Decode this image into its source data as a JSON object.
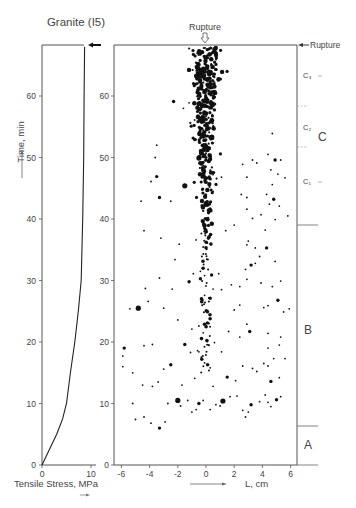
{
  "title": "Granite (I5)",
  "left_panel": {
    "ylabel": "Time, min",
    "xlabel": "Tensile Stress, MPa",
    "xticks": [
      "0",
      "10"
    ],
    "yticks": [
      "0",
      "10",
      "20",
      "30",
      "40",
      "50",
      "60"
    ]
  },
  "main_panel": {
    "top_label": "Rupture",
    "right_label": "Rupture",
    "xlabel": "L, cm",
    "xticks": [
      "-6",
      "-4",
      "-2",
      "0",
      "2",
      "4",
      "6"
    ],
    "yticks": [
      "0",
      "10",
      "20",
      "30",
      "40",
      "50",
      "60"
    ]
  },
  "stages": {
    "A": "A",
    "B": "B",
    "C": "C",
    "C1": "C₁",
    "C2": "C₂",
    "C3": "C₃"
  },
  "chart_data": [
    {
      "type": "line",
      "title": "Granite (I5)",
      "xlabel": "Tensile Stress, MPa",
      "ylabel": "Time, min",
      "xlim": [
        0,
        11
      ],
      "ylim": [
        0,
        68
      ],
      "series": [
        {
          "name": "Tensile stress vs time",
          "x": [
            0,
            1.5,
            3,
            4.2,
            5.0,
            5.8,
            6.7,
            7.4,
            8.0,
            8.3,
            8.5,
            8.6,
            8.7
          ],
          "y": [
            0,
            2.5,
            5,
            7.5,
            10,
            15,
            20,
            25,
            30,
            40,
            50,
            60,
            68
          ]
        }
      ],
      "annotations": [
        "Rupture arrow at t≈68 min"
      ]
    },
    {
      "type": "scatter",
      "xlabel": "L, cm",
      "ylabel": "Time, min",
      "xlim": [
        -6.5,
        6.5
      ],
      "ylim": [
        0,
        68
      ],
      "annotations": [
        "Rupture (top, at L=0)",
        "Rupture (right, t≈68)",
        "Stage A: 0–6 min",
        "Stage B: 6–39 min",
        "Stage C: 39–68 min (C1, C2, C3 sub-stages)"
      ],
      "stage_boundaries_min": [
        6.3,
        38.8,
        51.5,
        58.5,
        68
      ],
      "points": [
        [
          -5.8,
          19,
          2
        ],
        [
          -4.8,
          25.5,
          3
        ],
        [
          -5.4,
          25.4,
          1
        ],
        [
          -5.9,
          17.7,
          1
        ],
        [
          -5.9,
          16,
          1
        ],
        [
          -5.2,
          10,
          1
        ],
        [
          -5.0,
          7.4,
          1
        ],
        [
          -4.4,
          7.8,
          1
        ],
        [
          -3.9,
          6.8,
          1
        ],
        [
          -3.3,
          6,
          2
        ],
        [
          -2.9,
          7,
          1
        ],
        [
          -5.2,
          15,
          1
        ],
        [
          -4.5,
          13,
          1
        ],
        [
          -3.8,
          12.8,
          1
        ],
        [
          -3.4,
          13.5,
          1
        ],
        [
          -2.5,
          16.3,
          2
        ],
        [
          -2.0,
          10.5,
          3
        ],
        [
          -1.8,
          9.6,
          1
        ],
        [
          -2.7,
          10,
          1
        ],
        [
          -1.3,
          10.5,
          1
        ],
        [
          -1.0,
          8.6,
          1
        ],
        [
          -0.7,
          9,
          1
        ],
        [
          -0.5,
          10,
          2
        ],
        [
          -0.2,
          10.5,
          1
        ],
        [
          0.3,
          9,
          1
        ],
        [
          0.7,
          9.8,
          1
        ],
        [
          1.0,
          9.6,
          1
        ],
        [
          0.5,
          12.8,
          1
        ],
        [
          1.2,
          10.4,
          3
        ],
        [
          1.7,
          11.1,
          1
        ],
        [
          2.2,
          11.2,
          1
        ],
        [
          2.6,
          8.9,
          1
        ],
        [
          2.8,
          7.8,
          1
        ],
        [
          3.0,
          8.6,
          1
        ],
        [
          3.2,
          9.8,
          2
        ],
        [
          3.8,
          10.3,
          1
        ],
        [
          4.2,
          11.4,
          1
        ],
        [
          4.4,
          10.2,
          1
        ],
        [
          4.6,
          9.5,
          1
        ],
        [
          5.0,
          10.6,
          2
        ],
        [
          5.3,
          11.1,
          1
        ],
        [
          -0.3,
          17.2,
          2
        ],
        [
          -0.5,
          18.4,
          1
        ],
        [
          0.2,
          19.5,
          1
        ],
        [
          0.1,
          20.1,
          1
        ],
        [
          -0.6,
          18.6,
          1
        ],
        [
          -0.1,
          16.6,
          1
        ],
        [
          0.3,
          15.8,
          1
        ],
        [
          -0.8,
          14.1,
          1
        ],
        [
          -1.7,
          13,
          1
        ],
        [
          -3.0,
          15.6,
          1
        ],
        [
          -3.8,
          19.6,
          1
        ],
        [
          -4.4,
          19.4,
          1
        ],
        [
          -1.5,
          19.6,
          2
        ],
        [
          -1.1,
          18.3,
          1
        ],
        [
          -0.2,
          21.5,
          1
        ],
        [
          1.1,
          18.4,
          1
        ],
        [
          1.5,
          14.3,
          2
        ],
        [
          2.1,
          13.7,
          1
        ],
        [
          2.6,
          16.1,
          1
        ],
        [
          3.3,
          15.7,
          1
        ],
        [
          3.6,
          15.2,
          1
        ],
        [
          4.1,
          16.5,
          1
        ],
        [
          4.4,
          16.1,
          1
        ],
        [
          4.6,
          13.6,
          2
        ],
        [
          5.2,
          14.2,
          1
        ],
        [
          5.6,
          17.3,
          1
        ],
        [
          4.4,
          21.4,
          1
        ],
        [
          4.8,
          17.3,
          1
        ],
        [
          5.3,
          20.8,
          1
        ],
        [
          5.2,
          19.5,
          1
        ],
        [
          2.9,
          22.9,
          1
        ],
        [
          3.1,
          21.7,
          2
        ],
        [
          2.4,
          20.8,
          1
        ],
        [
          4.4,
          19.0,
          1
        ],
        [
          0.6,
          19.9,
          1
        ],
        [
          1.6,
          21.7,
          1
        ],
        [
          0.1,
          23.1,
          2
        ],
        [
          -0.5,
          22.6,
          1
        ],
        [
          -1.0,
          22.1,
          1
        ],
        [
          -2.0,
          23.6,
          1
        ],
        [
          -3.0,
          25.5,
          1
        ],
        [
          -2.4,
          28.6,
          1
        ],
        [
          -3.3,
          30.4,
          1
        ],
        [
          -4.1,
          26.6,
          1
        ],
        [
          -4.3,
          28.7,
          1
        ],
        [
          -1.2,
          29.8,
          2
        ],
        [
          -0.9,
          31.1,
          1
        ],
        [
          -0.4,
          31.5,
          1
        ],
        [
          -0.4,
          30.3,
          2
        ],
        [
          0.0,
          29.1,
          1
        ],
        [
          0.4,
          30.9,
          2
        ],
        [
          0.9,
          31.1,
          1
        ],
        [
          0.3,
          27.1,
          2
        ],
        [
          -0.1,
          27.6,
          1
        ],
        [
          -0.1,
          30.8,
          1
        ],
        [
          0.5,
          28.6,
          1
        ],
        [
          1.1,
          28.5,
          1
        ],
        [
          1.8,
          29.3,
          1
        ],
        [
          2.4,
          29.0,
          1
        ],
        [
          2.9,
          30.2,
          1
        ],
        [
          2.8,
          31.8,
          1
        ],
        [
          3.2,
          32.5,
          2
        ],
        [
          4.7,
          29.0,
          1
        ],
        [
          5.3,
          29.9,
          1
        ],
        [
          3.9,
          29.6,
          1
        ],
        [
          3.5,
          32.8,
          1
        ],
        [
          4.9,
          33.1,
          1
        ],
        [
          5.1,
          26.8,
          2
        ],
        [
          4.4,
          25.9,
          1
        ],
        [
          4.1,
          25.6,
          1
        ],
        [
          5.9,
          25.4,
          1
        ],
        [
          5.5,
          24.9,
          1
        ],
        [
          2.4,
          26.0,
          1
        ],
        [
          2.0,
          25.2,
          1
        ],
        [
          2.9,
          35.8,
          1
        ],
        [
          3.5,
          35.3,
          1
        ],
        [
          3.8,
          33.9,
          1
        ],
        [
          4.3,
          35.3,
          2
        ],
        [
          1.4,
          38.1,
          1
        ],
        [
          2.0,
          39.0,
          1
        ],
        [
          3.3,
          40.1,
          1
        ],
        [
          3.9,
          40.7,
          1
        ],
        [
          4.5,
          42.4,
          1
        ],
        [
          4.8,
          43.2,
          2
        ],
        [
          5.2,
          42.1,
          1
        ],
        [
          5.8,
          40.5,
          1
        ],
        [
          4.9,
          39.9,
          1
        ],
        [
          4.2,
          38.2,
          1
        ],
        [
          3.0,
          36.4,
          1
        ],
        [
          -0.7,
          36.6,
          1
        ],
        [
          -1.9,
          35.9,
          1
        ],
        [
          -2.2,
          33.4,
          1
        ],
        [
          -3.2,
          36.9,
          1
        ],
        [
          -4.4,
          38.1,
          1
        ],
        [
          -4.6,
          42.9,
          1
        ],
        [
          -3.3,
          43.5,
          2
        ],
        [
          -2.5,
          42.9,
          1
        ],
        [
          -3.5,
          46.9,
          2
        ],
        [
          -1.5,
          45.4,
          3
        ],
        [
          -3.9,
          46.1,
          1
        ],
        [
          -3.6,
          50.0,
          1
        ],
        [
          -3.5,
          52.0,
          1
        ],
        [
          -0.5,
          49.9,
          3
        ],
        [
          -0.8,
          56.1,
          1
        ],
        [
          -2.3,
          59.1,
          2
        ],
        [
          -1.2,
          58.9,
          1
        ],
        [
          -1.6,
          58.0,
          1
        ],
        [
          1.1,
          46.8,
          1
        ],
        [
          2.6,
          48.9,
          1
        ],
        [
          3.3,
          49.6,
          1
        ],
        [
          3.6,
          49.1,
          1
        ],
        [
          4.4,
          50.5,
          1
        ],
        [
          4.9,
          49.6,
          2
        ],
        [
          5.3,
          49.6,
          1
        ],
        [
          4.3,
          44.0,
          1
        ],
        [
          4.7,
          45.6,
          1
        ],
        [
          4.6,
          48.0,
          1
        ],
        [
          5.1,
          47.3,
          1
        ],
        [
          5.6,
          46.7,
          1
        ],
        [
          4.7,
          53.9,
          1
        ],
        [
          2.9,
          43.5,
          1
        ],
        [
          2.9,
          46.8,
          1
        ],
        [
          2.5,
          44.0,
          1
        ],
        [
          2.9,
          41.6,
          1
        ],
        [
          0.5,
          44.5,
          1
        ],
        [
          0.5,
          47.2,
          1
        ]
      ],
      "dense_cluster": {
        "L_center": 0,
        "t_range": [
          38,
          68
        ],
        "description": "dense column of acoustic emission events near L=0 during stage C"
      }
    }
  ]
}
